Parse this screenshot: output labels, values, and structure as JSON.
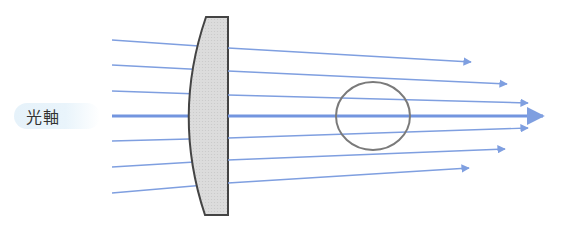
{
  "diagram": {
    "title": "",
    "optical_axis_label": "光軸",
    "colors": {
      "ray": "#7f9fe0",
      "axis_ray": "#7395df",
      "lens_fill": "#d9d9d9",
      "lens_stroke": "#444444",
      "circle_stroke": "#7a7a7a",
      "label_bg": "#e6f2fa"
    },
    "lens": {
      "type": "plano-convex",
      "points": "206,17 228,17 228,215 205,215",
      "curve_control": "172,116"
    },
    "focus_circle": {
      "cx": 373,
      "cy": 116,
      "rx": 37,
      "ry": 34
    },
    "rays": [
      {
        "y_in": 40,
        "y_lens": 48,
        "tip": [
          471,
          62
        ]
      },
      {
        "y_in": 65,
        "y_lens": 71,
        "tip": [
          507,
          84
        ]
      },
      {
        "y_in": 91,
        "y_lens": 95,
        "tip": [
          528,
          103
        ]
      },
      {
        "y_in": 116,
        "y_lens": 116,
        "tip": [
          543,
          116
        ],
        "axis": true
      },
      {
        "y_in": 141,
        "y_lens": 138,
        "tip": [
          528,
          128
        ]
      },
      {
        "y_in": 167,
        "y_lens": 160,
        "tip": [
          505,
          149
        ]
      },
      {
        "y_in": 193,
        "y_lens": 183,
        "tip": [
          469,
          168
        ]
      }
    ],
    "ray_start_x": 112,
    "lens_exit_x": 228
  }
}
